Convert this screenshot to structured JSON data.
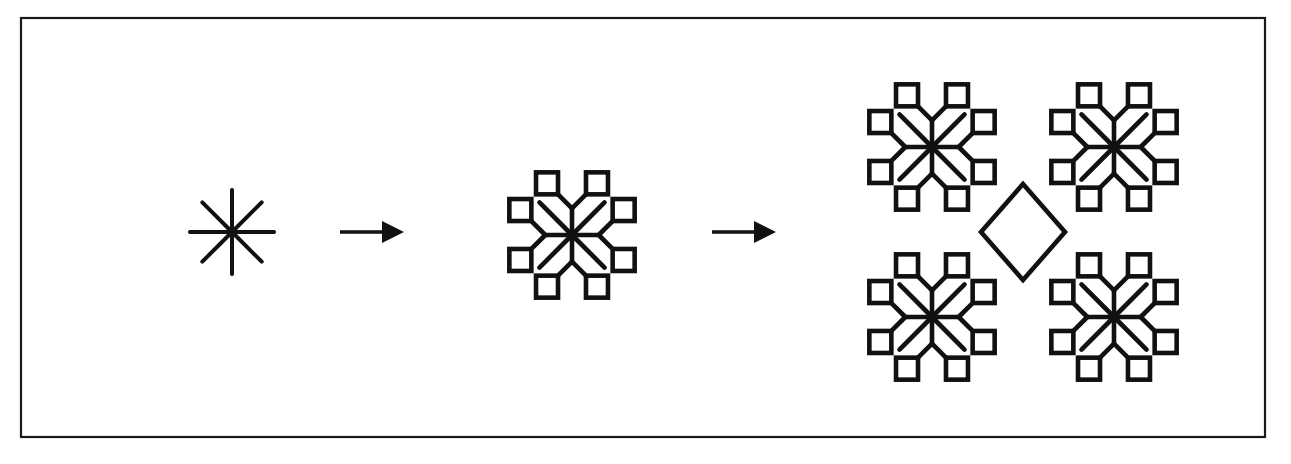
{
  "canvas": {
    "width": 1291,
    "height": 464,
    "background": "#ffffff",
    "ink": "#111111"
  },
  "frame": {
    "name": "figure-border",
    "x": 21,
    "y": 18,
    "width": 1244,
    "height": 419,
    "stroke_width": 2.2,
    "color": "#1a1a1a"
  },
  "motif": {
    "description": "Eight-armed asterisk; the four axis-aligned arms each fork into two 45-degree branches tipped with small open squares.",
    "arm_count": 8,
    "branching_arms": [
      "north",
      "east",
      "south",
      "west"
    ],
    "plain_arms": [
      "northeast",
      "southeast",
      "southwest",
      "northwest"
    ],
    "tip_shape": "square",
    "fork_fraction": 0.58,
    "branch_angle_deg": 45
  },
  "stages": [
    {
      "id": "stage-1",
      "name": "initiator-asterisk",
      "label": "iteration 0",
      "center": [
        232,
        232
      ],
      "radius": 42,
      "stroke_width": 4.0,
      "depth": 0,
      "squares": false,
      "tile": false
    },
    {
      "id": "stage-2",
      "name": "first-iteration-motif",
      "label": "iteration 1",
      "center": [
        572,
        235
      ],
      "radius": 46,
      "stroke_width": 4.6,
      "square_size": 22,
      "square_stroke": 4.6,
      "depth": 1,
      "squares": true,
      "tile": false
    },
    {
      "id": "stage-3",
      "name": "second-iteration-tiling",
      "label": "iteration 2",
      "center": [
        1023,
        232
      ],
      "radius": 46,
      "stroke_width": 4.6,
      "square_size": 22,
      "square_stroke": 4.6,
      "depth": 1,
      "squares": true,
      "tile": true,
      "tile_offsets": [
        [
          -91,
          -85
        ],
        [
          91,
          -85
        ],
        [
          -91,
          85
        ],
        [
          91,
          85
        ]
      ],
      "diamond": {
        "name": "center-diamond",
        "center": [
          1023,
          232
        ],
        "half_diagonal_x": 42,
        "half_diagonal_y": 48,
        "stroke_width": 4.6
      }
    }
  ],
  "arrows": [
    {
      "id": "arrow-1",
      "name": "transform-arrow-1",
      "label": "maps to",
      "x1": 340,
      "y1": 232,
      "x2": 404,
      "y2": 232,
      "shaft_width": 3.4,
      "head_length": 22,
      "head_half_width": 11
    },
    {
      "id": "arrow-2",
      "name": "transform-arrow-2",
      "label": "maps to",
      "x1": 712,
      "y1": 232,
      "x2": 776,
      "y2": 232,
      "shaft_width": 3.4,
      "head_length": 22,
      "head_half_width": 11
    }
  ]
}
